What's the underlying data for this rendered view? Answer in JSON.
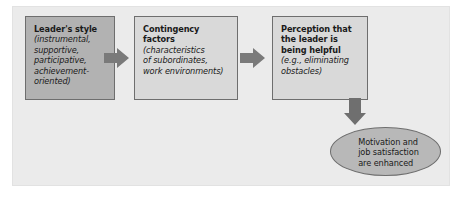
{
  "diagram": {
    "background_color": "#ebebeb",
    "boxes": [
      {
        "id": "leaders-style",
        "title": "Leader's style",
        "subtitle": "(instrumental,\nsupportive,\nparticipative,\nachievement-\noriented)",
        "fill": "#b2b2b2",
        "border": "#6e6e6e"
      },
      {
        "id": "contingency-factors",
        "title": "Contingency factors",
        "subtitle": "(characteristics\nof subordinates,\nwork environments)",
        "fill": "#d9d9d9",
        "border": "#6e6e6e"
      },
      {
        "id": "perception-helpful",
        "title": "Perception that\nthe leader is\nbeing helpful",
        "subtitle": "(e.g., eliminating\nobstacles)",
        "fill": "#d9d9d9",
        "border": "#6e6e6e"
      }
    ],
    "outcome": {
      "id": "motivation-satisfaction",
      "label": "Motivation and\njob satisfaction\nare enhanced",
      "fill": "#b8b8b8",
      "border": "#6e6e6e"
    },
    "arrows": [
      {
        "id": "arrow-style-to-contingency",
        "direction": "right",
        "color": "#7a7a7a"
      },
      {
        "id": "arrow-contingency-to-perception",
        "direction": "right",
        "color": "#7a7a7a"
      },
      {
        "id": "arrow-perception-to-outcome",
        "direction": "down",
        "color": "#6f6f6f"
      }
    ]
  }
}
